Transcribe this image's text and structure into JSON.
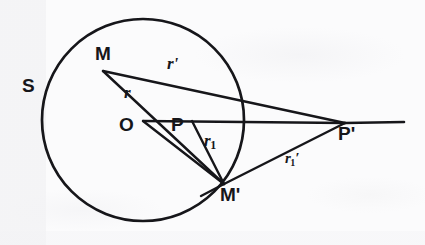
{
  "figure": {
    "background_color": "#fbfbfc",
    "ink_color": "#16161a"
  },
  "circle": {
    "name": "S",
    "label": "S",
    "center": {
      "x": 143,
      "y": 120
    },
    "radius": 101,
    "stroke_width": 2.6
  },
  "points": [
    {
      "id": "M",
      "label": "M",
      "x": 103,
      "y": 71,
      "label_x": 97,
      "label_y": 45
    },
    {
      "id": "O",
      "label": "O",
      "x": 143,
      "y": 121,
      "label_x": 121,
      "label_y": 117
    },
    {
      "id": "P",
      "label": "P",
      "x": 192,
      "y": 121,
      "label_x": 173,
      "label_y": 117
    },
    {
      "id": "Mp",
      "label": "M'",
      "x": 224,
      "y": 184,
      "label_x": 222,
      "label_y": 186
    },
    {
      "id": "Pp",
      "label": "P'",
      "x": 345,
      "y": 123,
      "label_x": 339,
      "label_y": 125
    }
  ],
  "segments": [
    {
      "id": "M-Pp",
      "from": "M",
      "to": "Pp",
      "label": "r'"
    },
    {
      "id": "M-Mp",
      "from": "M",
      "to": "Mp",
      "label": "r"
    },
    {
      "id": "O-Pp",
      "from": "O",
      "to": "Pp",
      "label": ""
    },
    {
      "id": "O-Mp",
      "from": "O",
      "to": "Mp",
      "label": ""
    },
    {
      "id": "P-Mp",
      "from": "P",
      "to": "Mp",
      "label": "r1"
    },
    {
      "id": "Mp-Pp",
      "from": "Mp",
      "to": "Pp",
      "label": "r1'"
    },
    {
      "id": "axis-ray",
      "from": "Pp",
      "to": "right-edge",
      "label": ""
    }
  ],
  "labels": {
    "sphere": "S",
    "m": "M",
    "m_prime": "M'",
    "o": "O",
    "p": "P",
    "p_prime": "P'",
    "r": "r",
    "r_prime": "r'",
    "r1_base": "r",
    "r1_sub": "1",
    "r1_prime_base": "r",
    "r1_prime_sub": "1",
    "prime_mark": "′"
  },
  "label_positions": {
    "sphere": {
      "x": 22,
      "y": 76
    },
    "m": {
      "x": 95,
      "y": 44
    },
    "r_prime": {
      "x": 167,
      "y": 55
    },
    "r": {
      "x": 124,
      "y": 84
    },
    "o": {
      "x": 119,
      "y": 115
    },
    "p": {
      "x": 171,
      "y": 115
    },
    "r1": {
      "x": 204,
      "y": 132
    },
    "m_prime": {
      "x": 220,
      "y": 185
    },
    "r1_prime": {
      "x": 285,
      "y": 151
    },
    "p_prime": {
      "x": 338,
      "y": 124
    }
  }
}
